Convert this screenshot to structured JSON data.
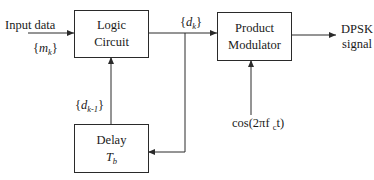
{
  "diagram": {
    "blocks": {
      "logic_circuit": {
        "line1": "Logic",
        "line2": "Circuit"
      },
      "product_modulator": {
        "line1": "Product",
        "line2": "Modulator"
      },
      "delay": {
        "line1": "Delay",
        "symbol": "T",
        "symbol_sub": "b"
      }
    },
    "labels": {
      "input": "Input data",
      "input_seq": {
        "open": "{",
        "var": "m",
        "sub": "k",
        "close": "}"
      },
      "dk": {
        "open": "{",
        "var": "d",
        "sub": "k",
        "close": "}"
      },
      "dk1": {
        "open": "{",
        "var": "d",
        "sub": "k-1",
        "close": "}"
      },
      "carrier": {
        "prefix": "cos(2πf ",
        "sub": "c",
        "suffix": "t)"
      },
      "output_line1": "DPSK",
      "output_line2": "signal"
    },
    "colors": {
      "line": "#2a2a2a",
      "background": "#ffffff"
    }
  }
}
